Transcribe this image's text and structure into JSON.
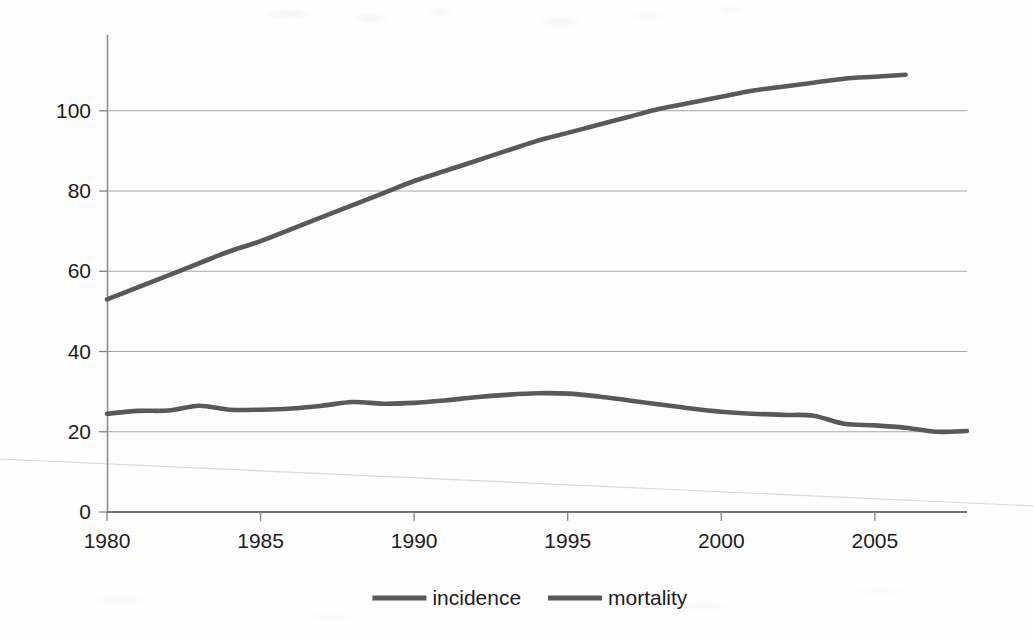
{
  "chart_data": {
    "type": "line",
    "title": "",
    "subtitle": "",
    "xlabel": "",
    "ylabel": "",
    "xlim": [
      1980,
      2008
    ],
    "ylim": [
      0,
      115
    ],
    "grid": "horizontal",
    "legend_position": "bottom-center",
    "x_tick_labels": [
      "1980",
      "1985",
      "1990",
      "1995",
      "2000",
      "2005"
    ],
    "x_ticks": [
      1980,
      1985,
      1990,
      1995,
      2000,
      2005
    ],
    "y_tick_labels": [
      "0",
      "20",
      "40",
      "60",
      "80",
      "100"
    ],
    "y_ticks": [
      0,
      20,
      40,
      60,
      80,
      100
    ],
    "series": [
      {
        "name": "incidence",
        "color": "#595959",
        "x": [
          1980,
          1981,
          1982,
          1983,
          1984,
          1985,
          1986,
          1987,
          1988,
          1989,
          1990,
          1991,
          1992,
          1993,
          1994,
          1995,
          1996,
          1997,
          1998,
          1999,
          2000,
          2001,
          2002,
          2003,
          2004,
          2005,
          2006
        ],
        "values": [
          53,
          56,
          59,
          62,
          65,
          67.5,
          70.5,
          73.5,
          76.5,
          79.5,
          82.5,
          85,
          87.5,
          90,
          92.5,
          94.5,
          96.5,
          98.5,
          100.5,
          102,
          103.5,
          105,
          106,
          107,
          108,
          108.5,
          109
        ]
      },
      {
        "name": "mortality",
        "color": "#595959",
        "x": [
          1980,
          1981,
          1982,
          1983,
          1984,
          1985,
          1986,
          1987,
          1988,
          1989,
          1990,
          1991,
          1992,
          1993,
          1994,
          1995,
          1996,
          1997,
          1998,
          1999,
          2000,
          2001,
          2002,
          2003,
          2004,
          2005,
          2006,
          2007,
          2008
        ],
        "values": [
          24.5,
          25.2,
          25.3,
          26.5,
          25.5,
          25.5,
          25.8,
          26.5,
          27.4,
          27.0,
          27.2,
          27.8,
          28.6,
          29.2,
          29.6,
          29.5,
          28.8,
          27.8,
          26.8,
          25.8,
          25.0,
          24.5,
          24.2,
          24.0,
          22.0,
          21.6,
          21.0,
          20.0,
          20.2
        ]
      }
    ],
    "legend": [
      {
        "label": "incidence",
        "color": "#595959"
      },
      {
        "label": "mortality",
        "color": "#595959"
      }
    ]
  },
  "axis": {
    "axis_color": "#808080",
    "gridline_color": "#a6a6a6",
    "tick_text_color": "#1c1c1c"
  },
  "artifact": {
    "diagonal_line_color": "#d8d8d8"
  }
}
